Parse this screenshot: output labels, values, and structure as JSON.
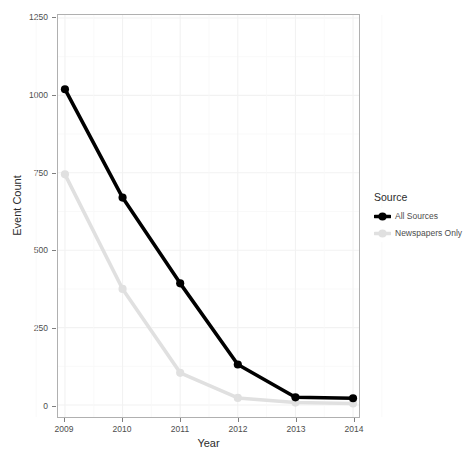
{
  "chart_data": {
    "type": "line",
    "title": "",
    "xlabel": "Year",
    "ylabel": "Event Count",
    "categories": [
      "2009",
      "2010",
      "2011",
      "2012",
      "2013",
      "2014"
    ],
    "x": [
      2009,
      2010,
      2011,
      2012,
      2013,
      2014
    ],
    "xlim": [
      2008.75,
      2014.25
    ],
    "ylim": [
      0,
      1250
    ],
    "yticks": [
      0,
      250,
      500,
      750,
      1000,
      1250
    ],
    "ytick_labels": [
      "0",
      "250",
      "500",
      "750",
      "1000",
      "1250"
    ],
    "xtick_labels": [
      "2009",
      "2010",
      "2011",
      "2012",
      "2013",
      "2014"
    ],
    "grid": true,
    "legend_position": "right",
    "legend_title": "Source",
    "series": [
      {
        "name": "All Sources",
        "color": "#000000",
        "values": [
          1020,
          670,
          393,
          131,
          25,
          22
        ]
      },
      {
        "name": "Newspapers Only",
        "color": "#e0e0e0",
        "values": [
          745,
          375,
          104,
          23,
          8,
          5
        ]
      }
    ]
  },
  "axes": {
    "x_title": "Year",
    "y_title": "Event Count"
  },
  "legend": {
    "title": "Source",
    "items": [
      {
        "label": "All Sources",
        "color": "#000000"
      },
      {
        "label": "Newspapers Only",
        "color": "#e0e0e0"
      }
    ]
  },
  "colors": {
    "panel_background": "#ffffff",
    "panel_border": "#b0b0b0",
    "gridline_major": "#f2f2f2",
    "gridline_minor": "#f8f8f8",
    "tick_mark": "#7f7f7f",
    "text": "#4d4d4d",
    "title_text": "#2b2b2b"
  }
}
